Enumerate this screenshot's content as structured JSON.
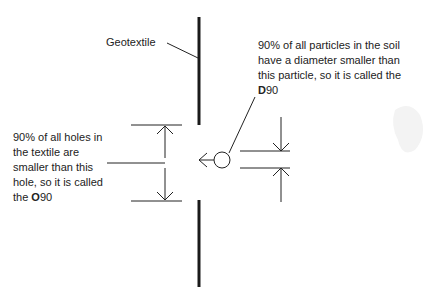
{
  "diagram": {
    "geotextile_label": "Geotextile",
    "particle_note": {
      "text": "90% of all particles in the soil have a diameter smaller than this particle, so it is called the ",
      "symbol_letter": "D",
      "symbol_number": "90"
    },
    "hole_note": {
      "text": "90% of all holes in the textile are smaller than this hole, so it is called the ",
      "symbol_letter": "O",
      "symbol_number": "90"
    },
    "colors": {
      "line": "#222222",
      "textile": "#1a1a1a",
      "background": "#ffffff"
    }
  }
}
